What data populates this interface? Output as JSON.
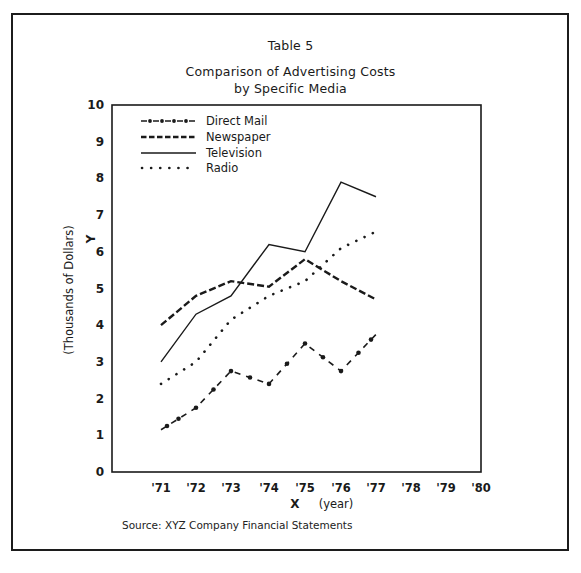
{
  "header": {
    "table_label": "Table 5",
    "title_line1": "Comparison of Advertising Costs",
    "title_line2": "by Specific Media"
  },
  "axes": {
    "y_label": "(Thousands of Dollars)",
    "y_letter": "Y",
    "x_letter": "X",
    "x_label": "(year)",
    "y_ticks": [
      "0",
      "1",
      "2",
      "3",
      "4",
      "5",
      "6",
      "7",
      "8",
      "9",
      "10"
    ],
    "x_ticks": [
      "'71",
      "'72",
      "'73",
      "'74",
      "'75",
      "'76",
      "'77",
      "'78",
      "'79",
      "'80"
    ]
  },
  "legend": {
    "items": [
      {
        "label": "Direct Mail",
        "style": "dash-dot"
      },
      {
        "label": "Newspaper",
        "style": "dashed"
      },
      {
        "label": "Television",
        "style": "solid"
      },
      {
        "label": "Radio",
        "style": "dotted"
      }
    ]
  },
  "footer": {
    "source": "Source:  XYZ Company Financial Statements"
  },
  "colors": {
    "ink": "#1a1a1a",
    "background": "#ffffff"
  },
  "chart_data": {
    "type": "line",
    "xlabel": "X (year)",
    "ylabel": "Y (Thousands of Dollars)",
    "x": [
      "'71",
      "'72",
      "'73",
      "'74",
      "'75",
      "'76",
      "'77"
    ],
    "x_axis_ticks": [
      "'71",
      "'72",
      "'73",
      "'74",
      "'75",
      "'76",
      "'77",
      "'78",
      "'79",
      "'80"
    ],
    "ylim": [
      0,
      10
    ],
    "y_ticks": [
      0,
      1,
      2,
      3,
      4,
      5,
      6,
      7,
      8,
      9,
      10
    ],
    "grid": false,
    "legend_position": "upper-left inside plot",
    "series": [
      {
        "name": "Direct Mail",
        "line_style": "dash-dot",
        "values": [
          1.15,
          1.75,
          2.75,
          2.4,
          3.5,
          2.75,
          3.75
        ]
      },
      {
        "name": "Newspaper",
        "line_style": "dashed",
        "values": [
          4.0,
          4.8,
          5.2,
          5.05,
          5.8,
          5.2,
          4.7
        ]
      },
      {
        "name": "Television",
        "line_style": "solid",
        "values": [
          3.0,
          4.3,
          4.8,
          6.2,
          6.0,
          7.9,
          7.5
        ]
      },
      {
        "name": "Radio",
        "line_style": "dotted",
        "values": [
          2.4,
          3.0,
          4.15,
          4.8,
          5.2,
          6.1,
          6.55
        ]
      }
    ],
    "source": "Source: XYZ Company Financial Statements"
  }
}
